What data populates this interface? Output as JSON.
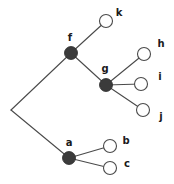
{
  "diagram": {
    "type": "phylogenetic-tree",
    "canvas": {
      "width": 174,
      "height": 184
    },
    "colors": {
      "background": "#ffffff",
      "edge": "#4a4a4a",
      "filled_node_fill": "#3b3b3b",
      "open_node_fill": "#ffffff",
      "node_stroke": "#4a4a4a",
      "label_color": "#1a1a1a"
    },
    "style": {
      "node_radius": 6.5,
      "edge_width": 1.1,
      "label_font_size": 10
    },
    "root": {
      "name": "root-vertex",
      "x": 11,
      "y": 110
    },
    "nodes": [
      {
        "id": "f",
        "label": "f",
        "kind": "filled",
        "cx": 71,
        "cy": 53,
        "label_x": 70,
        "label_y": 38
      },
      {
        "id": "g",
        "label": "g",
        "kind": "filled",
        "cx": 106,
        "cy": 85,
        "label_x": 105,
        "label_y": 69
      },
      {
        "id": "a",
        "label": "a",
        "kind": "filled",
        "cx": 69,
        "cy": 158,
        "label_x": 69,
        "label_y": 143
      },
      {
        "id": "k",
        "label": "k",
        "kind": "open",
        "cx": 106,
        "cy": 21,
        "label_x": 119,
        "label_y": 13
      },
      {
        "id": "h",
        "label": "h",
        "kind": "open",
        "cx": 144,
        "cy": 54,
        "label_x": 161,
        "label_y": 44
      },
      {
        "id": "i",
        "label": "i",
        "kind": "open",
        "cx": 141,
        "cy": 84,
        "label_x": 160,
        "label_y": 77
      },
      {
        "id": "j",
        "label": "j",
        "kind": "open",
        "cx": 143,
        "cy": 110,
        "label_x": 161,
        "label_y": 117
      },
      {
        "id": "b",
        "label": "b",
        "kind": "open",
        "cx": 110,
        "cy": 146,
        "label_x": 126,
        "label_y": 141
      },
      {
        "id": "c",
        "label": "c",
        "kind": "open",
        "cx": 110,
        "cy": 168,
        "label_x": 127,
        "label_y": 164
      }
    ],
    "edges": [
      {
        "id": "root-f",
        "from": "root-vertex",
        "to": "f",
        "x1": 11,
        "y1": 110,
        "x2": 71,
        "y2": 53
      },
      {
        "id": "root-a",
        "from": "root-vertex",
        "to": "a",
        "x1": 11,
        "y1": 110,
        "x2": 69,
        "y2": 158
      },
      {
        "id": "f-k",
        "from": "f",
        "to": "k",
        "x1": 71,
        "y1": 53,
        "x2": 106,
        "y2": 21
      },
      {
        "id": "f-g",
        "from": "f",
        "to": "g",
        "x1": 71,
        "y1": 53,
        "x2": 106,
        "y2": 85
      },
      {
        "id": "g-h",
        "from": "g",
        "to": "h",
        "x1": 106,
        "y1": 85,
        "x2": 144,
        "y2": 54
      },
      {
        "id": "g-i",
        "from": "g",
        "to": "i",
        "x1": 106,
        "y1": 85,
        "x2": 141,
        "y2": 84
      },
      {
        "id": "g-j",
        "from": "g",
        "to": "j",
        "x1": 106,
        "y1": 85,
        "x2": 143,
        "y2": 110
      },
      {
        "id": "a-b",
        "from": "a",
        "to": "b",
        "x1": 69,
        "y1": 158,
        "x2": 110,
        "y2": 146
      },
      {
        "id": "a-c",
        "from": "a",
        "to": "c",
        "x1": 69,
        "y1": 158,
        "x2": 110,
        "y2": 168
      }
    ]
  }
}
